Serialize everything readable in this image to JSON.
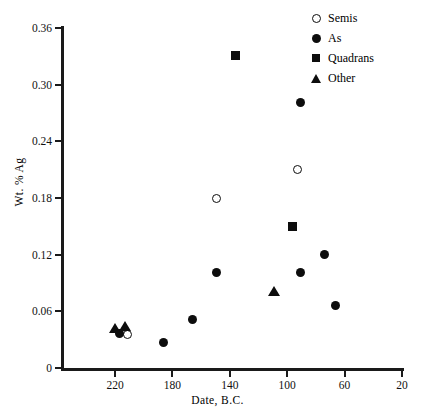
{
  "chart_data": {
    "type": "scatter",
    "title": "",
    "xlabel": "Date,  B.C.",
    "ylabel": "Wt. % Ag",
    "xlim": [
      240,
      20
    ],
    "ylim": [
      0,
      0.36
    ],
    "x_ticks": [
      220,
      180,
      140,
      100,
      60,
      20
    ],
    "x_tick_labels": [
      "220",
      "180",
      "140",
      "100",
      "60",
      "20"
    ],
    "y_ticks": [
      0,
      0.06,
      0.12,
      0.18,
      0.24,
      0.3,
      0.36
    ],
    "y_tick_labels": [
      "0",
      "0.06",
      "0.12",
      "0.18",
      "0.24",
      "0.30",
      "0.36"
    ],
    "x_axis_inverted": true,
    "grid": false,
    "legend_position": "top-right",
    "series": [
      {
        "name": "Semis",
        "marker": "circle-open",
        "color": "#0d0d0d",
        "points": [
          {
            "x": 211,
            "y": 0.036
          },
          {
            "x": 149,
            "y": 0.179
          },
          {
            "x": 93,
            "y": 0.21
          }
        ]
      },
      {
        "name": "As",
        "marker": "circle-filled",
        "color": "#0d0d0d",
        "points": [
          {
            "x": 217,
            "y": 0.037
          },
          {
            "x": 186,
            "y": 0.027
          },
          {
            "x": 166,
            "y": 0.051
          },
          {
            "x": 149,
            "y": 0.101
          },
          {
            "x": 91,
            "y": 0.281
          },
          {
            "x": 91,
            "y": 0.101
          },
          {
            "x": 74,
            "y": 0.12
          },
          {
            "x": 66,
            "y": 0.066
          }
        ]
      },
      {
        "name": "Quadrans",
        "marker": "square-filled",
        "color": "#0d0d0d",
        "points": [
          {
            "x": 136,
            "y": 0.331
          },
          {
            "x": 96,
            "y": 0.15
          }
        ]
      },
      {
        "name": "Other",
        "marker": "triangle-filled",
        "color": "#0d0d0d",
        "points": [
          {
            "x": 220,
            "y": 0.042
          },
          {
            "x": 213,
            "y": 0.044
          },
          {
            "x": 109,
            "y": 0.082
          }
        ]
      }
    ]
  },
  "legend": {
    "items": [
      {
        "label": "Semis",
        "marker": "circle-open"
      },
      {
        "label": "As",
        "marker": "circle-filled"
      },
      {
        "label": "Quadrans",
        "marker": "square-filled"
      },
      {
        "label": "Other",
        "marker": "triangle-filled"
      }
    ]
  }
}
